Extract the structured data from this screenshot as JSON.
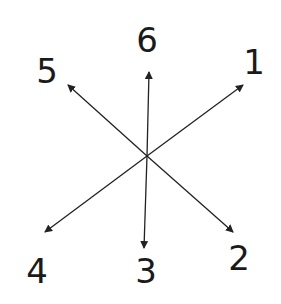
{
  "diagram": {
    "center": [
      147,
      156
    ],
    "line_color": "#222222",
    "arrows": [
      {
        "id": "1",
        "label": "1",
        "tip": [
          243,
          85
        ],
        "label_pos": [
          254,
          62
        ]
      },
      {
        "id": "2",
        "label": "2",
        "tip": [
          233,
          232
        ],
        "label_pos": [
          239,
          258
        ]
      },
      {
        "id": "3",
        "label": "3",
        "tip": [
          144,
          248
        ],
        "label_pos": [
          146,
          271
        ]
      },
      {
        "id": "4",
        "label": "4",
        "tip": [
          45,
          232
        ],
        "label_pos": [
          37,
          271
        ]
      },
      {
        "id": "5",
        "label": "5",
        "tip": [
          68,
          85
        ],
        "label_pos": [
          47,
          71
        ]
      },
      {
        "id": "6",
        "label": "6",
        "tip": [
          149,
          72
        ],
        "label_pos": [
          147,
          40
        ]
      }
    ]
  }
}
